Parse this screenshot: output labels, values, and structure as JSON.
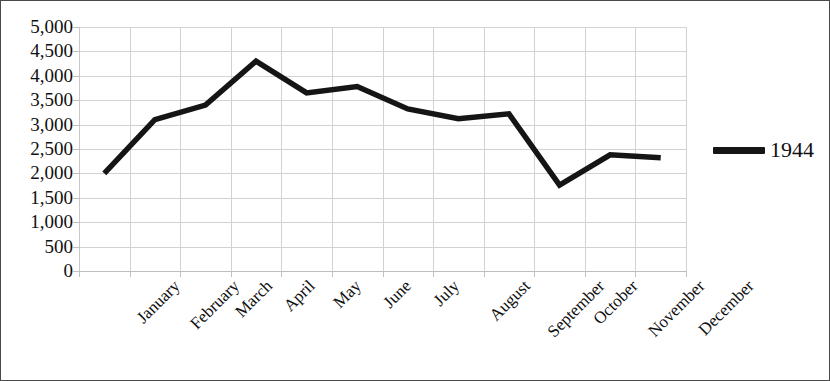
{
  "chart_data": {
    "type": "line",
    "title": "",
    "xlabel": "",
    "ylabel": "",
    "categories": [
      "January",
      "February",
      "March",
      "April",
      "May",
      "June",
      "July",
      "August",
      "September",
      "October",
      "November",
      "December"
    ],
    "series": [
      {
        "name": "1944",
        "values": [
          2000,
          3100,
          3400,
          4300,
          3650,
          3780,
          3320,
          3120,
          3220,
          1760,
          2380,
          2320
        ]
      }
    ],
    "ylim": [
      0,
      5000
    ],
    "y_ticks": [
      0,
      500,
      1000,
      1500,
      2000,
      2500,
      3000,
      3500,
      4000,
      4500,
      5000
    ],
    "y_tick_labels": [
      "0",
      "500",
      "1,000",
      "1,500",
      "2,000",
      "2,500",
      "3,000",
      "3,500",
      "4,000",
      "4,500",
      "5,000"
    ],
    "grid": true,
    "legend_position": "right",
    "line_color": "#151515",
    "grid_color": "#d2d2d2"
  },
  "legend": {
    "entries": [
      {
        "label": "1944",
        "marker": "line-swatch"
      }
    ]
  },
  "axes": {
    "y_tick_labels": [
      "5,000",
      "4,500",
      "4,000",
      "3,500",
      "3,000",
      "2,500",
      "2,000",
      "1,500",
      "1,000",
      "500",
      "0"
    ],
    "x_tick_labels": [
      "January",
      "February",
      "March",
      "April",
      "May",
      "June",
      "July",
      "August",
      "September",
      "October",
      "November",
      "December"
    ]
  }
}
